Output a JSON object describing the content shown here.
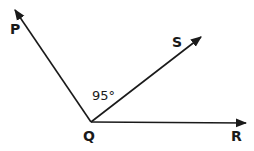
{
  "diagram": {
    "type": "angle-diagram",
    "vertex": {
      "label": "Q",
      "x": 91,
      "y": 122
    },
    "rays": [
      {
        "label": "P",
        "tip": {
          "x": 15,
          "y": 10
        },
        "label_pos": {
          "x": 10,
          "y": 34
        }
      },
      {
        "label": "S",
        "tip": {
          "x": 201,
          "y": 37
        },
        "label_pos": {
          "x": 172,
          "y": 47
        }
      },
      {
        "label": "R",
        "tip": {
          "x": 246,
          "y": 123
        },
        "label_pos": {
          "x": 231,
          "y": 141
        }
      }
    ],
    "angle_label": {
      "text": "95°",
      "between": [
        "P",
        "S"
      ],
      "x": 92,
      "y": 100
    },
    "vertex_label_pos": {
      "x": 83,
      "y": 141
    },
    "colors": {
      "line": "#1a1a1a",
      "background": "#ffffff"
    }
  }
}
